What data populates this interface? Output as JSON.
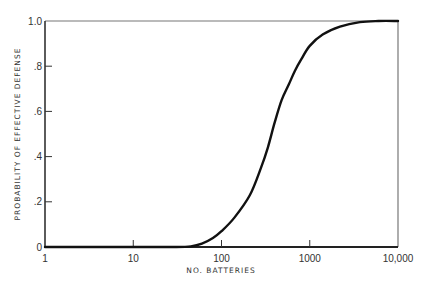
{
  "chart_data": {
    "type": "line",
    "title": "",
    "xlabel": "NO. BATTERIES",
    "ylabel": "PROBABILITY OF EFFECTIVE DEFENSE",
    "xscale": "log",
    "xlim": [
      1,
      10000
    ],
    "ylim": [
      0,
      1.0
    ],
    "grid": false,
    "legend": "none",
    "x_ticks": [
      {
        "value": 1,
        "label": "1"
      },
      {
        "value": 10,
        "label": "10"
      },
      {
        "value": 100,
        "label": "100"
      },
      {
        "value": 1000,
        "label": "1000"
      },
      {
        "value": 10000,
        "label": "10,000"
      }
    ],
    "y_ticks": [
      {
        "value": 0,
        "label": "0"
      },
      {
        "value": 0.2,
        "label": ".2"
      },
      {
        "value": 0.4,
        "label": ".4"
      },
      {
        "value": 0.6,
        "label": ".6"
      },
      {
        "value": 0.8,
        "label": ".8"
      },
      {
        "value": 1.0,
        "label": "1.0"
      }
    ],
    "series": [
      {
        "name": "Probability of effective defense",
        "color": "#111111",
        "x": [
          1,
          10,
          30,
          45,
          60,
          80,
          100,
          140,
          210,
          280,
          335,
          400,
          480,
          580,
          680,
          800,
          1000,
          1400,
          2200,
          3700,
          6000,
          10000
        ],
        "y": [
          0,
          0,
          0,
          0.003,
          0.015,
          0.04,
          0.07,
          0.13,
          0.23,
          0.35,
          0.44,
          0.55,
          0.65,
          0.72,
          0.78,
          0.83,
          0.89,
          0.94,
          0.975,
          0.995,
          1.0,
          1.0
        ]
      }
    ]
  }
}
